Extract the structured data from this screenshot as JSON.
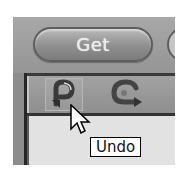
{
  "top_toolbar": {
    "get_button_label": "Get"
  },
  "icon_toolbar": {
    "buttons": [
      {
        "name": "undo",
        "icon": "undo-icon"
      },
      {
        "name": "redo",
        "icon": "redo-icon"
      }
    ]
  },
  "tooltip": {
    "text": "Undo"
  },
  "colors": {
    "toolbar_gray": "#9a9a9a",
    "pill_border": "#5e5e5e",
    "pill_label": "#ececec",
    "divider_dark": "#3a3a3a",
    "panel_light": "#e2e2e2",
    "tooltip_bg": "#ffffff",
    "tooltip_border": "#000000"
  }
}
